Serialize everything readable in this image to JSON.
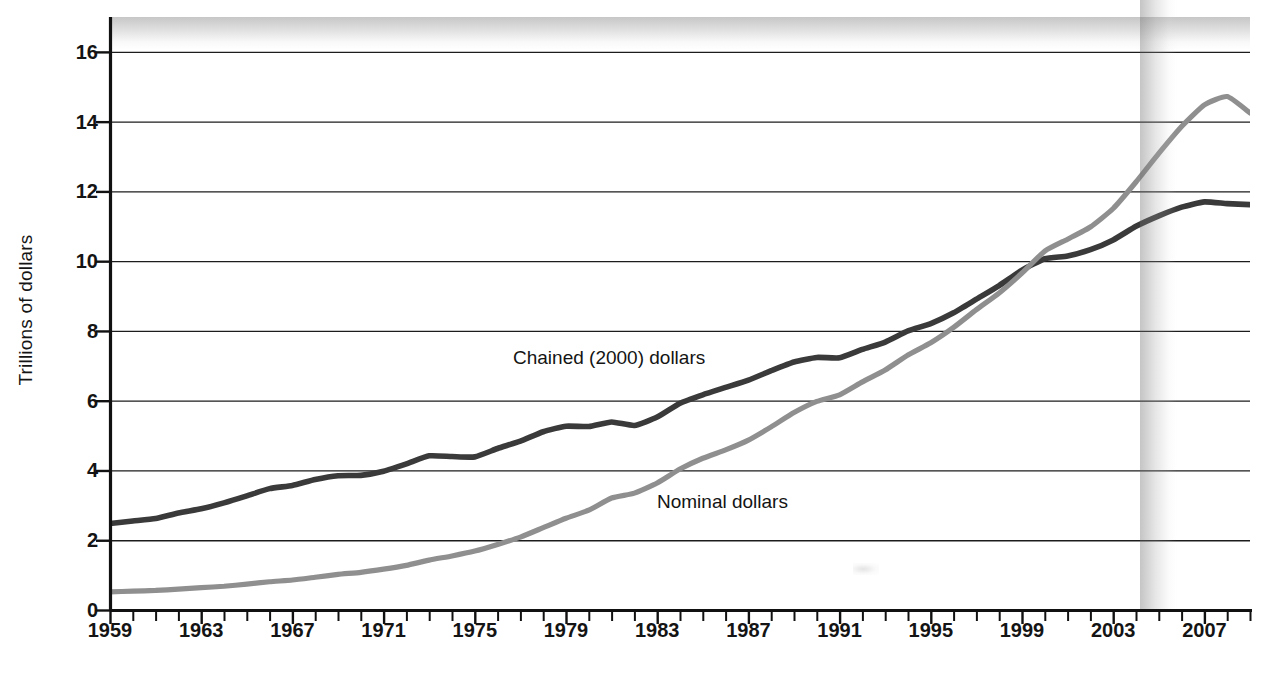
{
  "chart_data": {
    "type": "line",
    "title": "",
    "xlabel": "",
    "ylabel": "Trillions of dollars",
    "xlim": [
      1959,
      2009
    ],
    "ylim": [
      0,
      17
    ],
    "grid": true,
    "grid_axis": "y",
    "legend_position": "inline-annotations",
    "y_ticks": [
      0,
      2,
      4,
      6,
      8,
      10,
      12,
      14,
      16
    ],
    "y_tick_labels": [
      "0",
      "2",
      "4",
      "6",
      "8",
      "10",
      "12",
      "14",
      "16"
    ],
    "x_ticks": [
      1959,
      1963,
      1967,
      1971,
      1975,
      1979,
      1983,
      1987,
      1991,
      1995,
      1999,
      2003,
      2007
    ],
    "x_tick_labels": [
      "1959",
      "1963",
      "1967",
      "1971",
      "1975",
      "1979",
      "1983",
      "1987",
      "1991",
      "1995",
      "1999",
      "2003",
      "2007"
    ],
    "x_minor_tick_interval": 1,
    "x": [
      1959,
      1960,
      1961,
      1962,
      1963,
      1964,
      1965,
      1966,
      1967,
      1968,
      1969,
      1970,
      1971,
      1972,
      1973,
      1974,
      1975,
      1976,
      1977,
      1978,
      1979,
      1980,
      1981,
      1982,
      1983,
      1984,
      1985,
      1986,
      1987,
      1988,
      1989,
      1990,
      1991,
      1992,
      1993,
      1994,
      1995,
      1996,
      1997,
      1998,
      1999,
      2000,
      2001,
      2002,
      2003,
      2004,
      2005,
      2006,
      2007,
      2008,
      2009
    ],
    "series": [
      {
        "name": "Chained (2000) dollars",
        "color": "#3a3a3a",
        "label_position": {
          "x": 1978.0,
          "y": 7.05
        },
        "values": [
          2.48,
          2.55,
          2.62,
          2.78,
          2.9,
          3.07,
          3.27,
          3.48,
          3.57,
          3.74,
          3.85,
          3.86,
          3.98,
          4.19,
          4.42,
          4.4,
          4.39,
          4.63,
          4.84,
          5.11,
          5.27,
          5.26,
          5.39,
          5.29,
          5.53,
          5.93,
          6.17,
          6.38,
          6.59,
          6.86,
          7.11,
          7.24,
          7.23,
          7.47,
          7.68,
          8.0,
          8.21,
          8.52,
          8.91,
          9.3,
          9.74,
          10.07,
          10.15,
          10.33,
          10.61,
          11.0,
          11.3,
          11.55,
          11.7,
          11.65,
          11.62
        ]
      },
      {
        "name": "Nominal dollars",
        "color": "#8f8f8f",
        "label_position": {
          "x": 1985.0,
          "y": 3.05
        },
        "values": [
          0.52,
          0.54,
          0.56,
          0.6,
          0.64,
          0.68,
          0.74,
          0.81,
          0.86,
          0.94,
          1.02,
          1.08,
          1.17,
          1.28,
          1.43,
          1.55,
          1.69,
          1.88,
          2.09,
          2.36,
          2.63,
          2.86,
          3.21,
          3.35,
          3.64,
          4.04,
          4.35,
          4.59,
          4.87,
          5.25,
          5.66,
          5.98,
          6.17,
          6.54,
          6.88,
          7.31,
          7.66,
          8.1,
          8.61,
          9.09,
          9.66,
          10.29,
          10.63,
          10.98,
          11.51,
          12.27,
          13.09,
          13.86,
          14.48,
          14.72,
          14.25
        ]
      }
    ],
    "annotations": [
      {
        "text": "Chained (2000) dollars",
        "name": "series-label-chained"
      },
      {
        "text": "Nominal dollars",
        "name": "series-label-nominal"
      }
    ]
  }
}
